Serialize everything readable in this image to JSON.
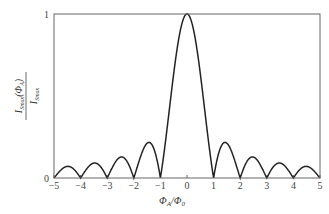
{
  "chart_data": {
    "type": "line",
    "title": "",
    "xlabel": "Φ_A/Φ_0",
    "ylabel": "I_Smax(Φ_A) / I_Smax",
    "xlim": [
      -5,
      5
    ],
    "ylim": [
      0,
      1
    ],
    "x_ticks": [
      "-5",
      "-4",
      "-3",
      "-2",
      "-1",
      "0",
      "1",
      "2",
      "3",
      "4",
      "5"
    ],
    "y_ticks": [
      "0",
      "1"
    ],
    "grid": false,
    "legend": null,
    "function": "|sin(πx)/(πx)|",
    "series": [
      {
        "name": "Fraunhofer pattern",
        "x": [
          -5,
          -4.5,
          -4,
          -3.5,
          -3,
          -2.5,
          -2,
          -1.5,
          -1,
          -0.5,
          0,
          0.5,
          1,
          1.5,
          2,
          2.5,
          3,
          3.5,
          4,
          4.5,
          5
        ],
        "values": [
          0,
          0.071,
          0,
          0.091,
          0,
          0.127,
          0,
          0.212,
          0,
          0.637,
          1,
          0.637,
          0,
          0.212,
          0,
          0.127,
          0,
          0.091,
          0,
          0.071,
          0
        ]
      }
    ],
    "side_lobe_peaks": [
      {
        "x": 1.43,
        "y": 0.217
      },
      {
        "x": 2.46,
        "y": 0.128
      },
      {
        "x": 3.47,
        "y": 0.091
      },
      {
        "x": 4.48,
        "y": 0.071
      }
    ]
  },
  "labels": {
    "xlabel_main": "Φ",
    "xlabel_sub1": "A",
    "xlabel_div": "/Φ",
    "xlabel_sub2": "0",
    "ylabel_num": "I",
    "ylabel_num_sub": "Smax",
    "ylabel_num_arg": "(Φ",
    "ylabel_num_arg_sub": "A",
    "ylabel_num_close": ")",
    "ylabel_den": "I",
    "ylabel_den_sub": "Smax"
  },
  "y_tick_labels": {
    "bottom": "0",
    "top": "1"
  }
}
